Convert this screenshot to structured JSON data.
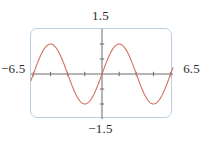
{
  "figure": {
    "name": "graphing-calculator-plot",
    "colors": {
      "curve": "#d4705f",
      "axis": "#6b6b6b",
      "frame": "#b9cfe4",
      "text": "#2b2b2b",
      "background": "#ffffff"
    }
  },
  "labels": {
    "ymax": "1.5",
    "ymin": "−1.5",
    "xmin": "−6.5",
    "xmax": "6.5"
  },
  "chart_data": {
    "type": "line",
    "title": "",
    "xlabel": "",
    "ylabel": "",
    "xlim": [
      -6.5,
      6.5
    ],
    "ylim": [
      -1.5,
      1.5
    ],
    "grid": false,
    "legend": null,
    "axes": {
      "x_axis_at_y": 0,
      "y_axis_at_x": 0,
      "x_tick_spacing": 1.5707963,
      "y_tick_spacing": 0.5,
      "x_ticks": [
        -6.2832,
        -4.7124,
        -3.1416,
        -1.5708,
        1.5708,
        3.1416,
        4.7124,
        6.2832
      ],
      "y_ticks": [
        -1.5,
        -1.0,
        -0.5,
        0.5,
        1.0,
        1.5
      ],
      "tick_labels_shown": false
    },
    "series": [
      {
        "name": "y = sin(x)",
        "expression": "sin(x)",
        "color": "#d4705f",
        "amplitude": 1.0,
        "period": 6.2832,
        "phase": 0,
        "x": [
          -6.5,
          -6.1,
          -5.7,
          -5.3,
          -4.9,
          -4.5,
          -4.1,
          -3.7,
          -3.3,
          -2.9,
          -2.5,
          -2.1,
          -1.7,
          -1.3,
          -0.9,
          -0.5,
          -0.1,
          0.3,
          0.7,
          1.1,
          1.5,
          1.9,
          2.3,
          2.7,
          3.1,
          3.5,
          3.9,
          4.3,
          4.7,
          5.1,
          5.5,
          5.9,
          6.3,
          6.5
        ],
        "values": [
          -0.2151,
          -0.1674,
          0.5507,
          0.8323,
          0.9825,
          0.9775,
          0.8183,
          0.5298,
          0.1577,
          -0.2392,
          -0.5985,
          -0.8632,
          -0.9917,
          -0.9636,
          -0.7833,
          -0.4794,
          -0.0998,
          0.2955,
          0.6442,
          0.8912,
          0.9975,
          0.9463,
          0.7457,
          0.4274,
          0.0416,
          -0.3508,
          -0.6878,
          -0.9162,
          -0.99999,
          -0.9258,
          -0.7055,
          -0.3739,
          0.0168,
          0.2151
        ]
      }
    ]
  }
}
